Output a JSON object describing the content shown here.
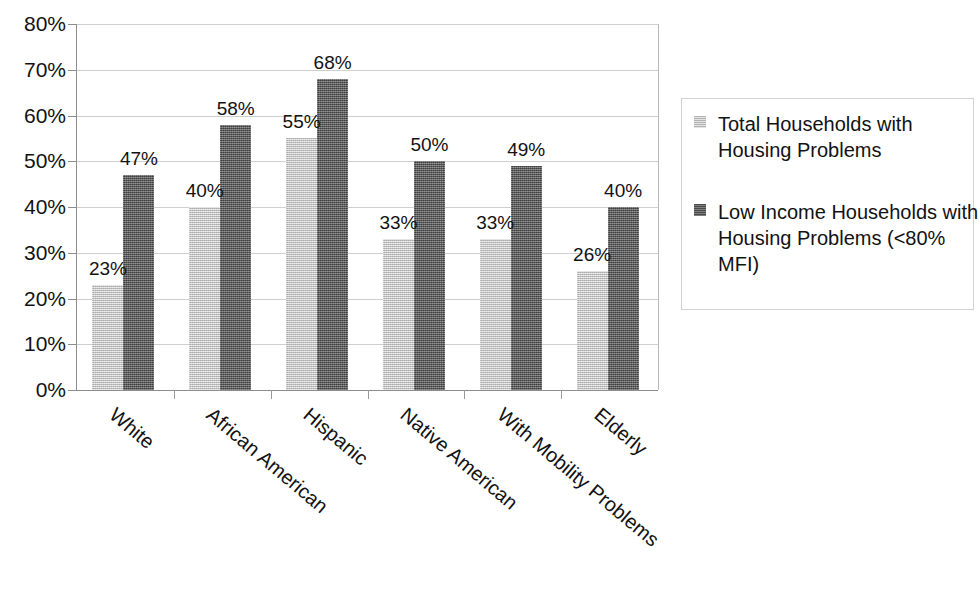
{
  "chart_data": {
    "type": "bar",
    "title": "",
    "subtitle": "",
    "xlabel": "",
    "ylabel": "",
    "ylim": [
      0,
      80
    ],
    "ytick_step": 10,
    "grid": true,
    "legend_position": "right",
    "value_labels": true,
    "categories": [
      "White",
      "African American",
      "Hispanic",
      "Native American",
      "With Mobility Problems",
      "Elderly"
    ],
    "ytick_labels": [
      "0%",
      "10%",
      "20%",
      "30%",
      "40%",
      "50%",
      "60%",
      "70%",
      "80%"
    ],
    "ytick_values": [
      0,
      10,
      20,
      30,
      40,
      50,
      60,
      70,
      80
    ],
    "series": [
      {
        "name": "Total Households with Housing Problems",
        "color": "#c6c6c6",
        "values": [
          23,
          40,
          55,
          33,
          33,
          26
        ],
        "value_labels": [
          "23%",
          "40%",
          "55%",
          "33%",
          "33%",
          "26%"
        ]
      },
      {
        "name": "Low Income Households with Housing Problems (<80% MFI)",
        "color": "#5e5e5e",
        "values": [
          47,
          58,
          68,
          50,
          49,
          40
        ],
        "value_labels": [
          "47%",
          "58%",
          "68%",
          "50%",
          "49%",
          "40%"
        ]
      }
    ]
  },
  "legend": {
    "entries": [
      {
        "label": "Total Households with Housing Problems",
        "color": "#c6c6c6"
      },
      {
        "label": "Low Income Households with Housing Problems (<80% MFI)",
        "color": "#5e5e5e"
      }
    ]
  },
  "colors": {
    "series_light": "#c6c6c6",
    "series_dark": "#5e5e5e",
    "gridline": "#cfcfcf",
    "axis": "#8d8d8d",
    "text": "#121212",
    "legend_border": "#d3d3d3",
    "background": "#ffffff"
  }
}
